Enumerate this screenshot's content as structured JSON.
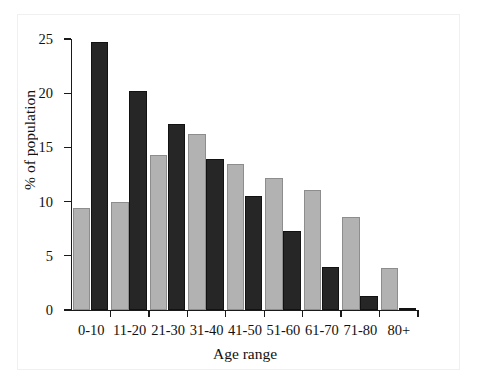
{
  "chart_data": {
    "type": "bar",
    "title": "",
    "subtitle": "",
    "xlabel": "Age range",
    "ylabel": "% of population",
    "categories": [
      "0-10",
      "11-20",
      "21-30",
      "31-40",
      "41-50",
      "51-60",
      "61-70",
      "71-80",
      "80+"
    ],
    "yticks": [
      0,
      5,
      10,
      15,
      20,
      25
    ],
    "ylim": [
      0,
      25
    ],
    "grid": false,
    "legend": "none",
    "series": [
      {
        "name": "light-gray-series",
        "color": "#b2b2b2",
        "values": [
          9.4,
          10.0,
          14.3,
          16.2,
          13.5,
          12.2,
          11.1,
          8.6,
          3.9
        ]
      },
      {
        "name": "dark-series",
        "color": "#262626",
        "values": [
          24.7,
          20.2,
          17.2,
          13.9,
          10.5,
          7.3,
          4.0,
          1.3,
          0.2
        ]
      }
    ],
    "annotations": []
  },
  "axis": {
    "ytick_labels": [
      "25",
      "20",
      "15",
      "10",
      "5",
      "0"
    ]
  }
}
